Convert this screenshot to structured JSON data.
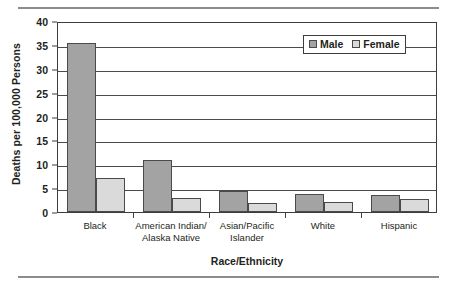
{
  "chart_data": {
    "type": "bar",
    "title": "",
    "xlabel": "Race/Ethnicity",
    "ylabel": "Deaths per 100,000 Persons",
    "categories": [
      "Black",
      "American Indian/\nAlaska Native",
      "Asian/Pacific\nIslander",
      "White",
      "Hispanic"
    ],
    "series": [
      {
        "name": "Male",
        "color": "#a3a3a3",
        "values": [
          35.5,
          10.8,
          4.4,
          3.8,
          3.6
        ]
      },
      {
        "name": "Female",
        "color": "#dadada",
        "values": [
          7.1,
          2.9,
          1.9,
          2.1,
          2.7
        ]
      }
    ],
    "ylim": [
      0,
      40
    ],
    "yticks": [
      0,
      5,
      10,
      15,
      20,
      25,
      30,
      35,
      40
    ],
    "grid": true,
    "legend_position": "top-right"
  },
  "legend": {
    "items": [
      {
        "label": "Male"
      },
      {
        "label": "Female"
      }
    ]
  },
  "icons": {
    "male_swatch": "square-swatch-icon",
    "female_swatch": "square-swatch-icon"
  }
}
